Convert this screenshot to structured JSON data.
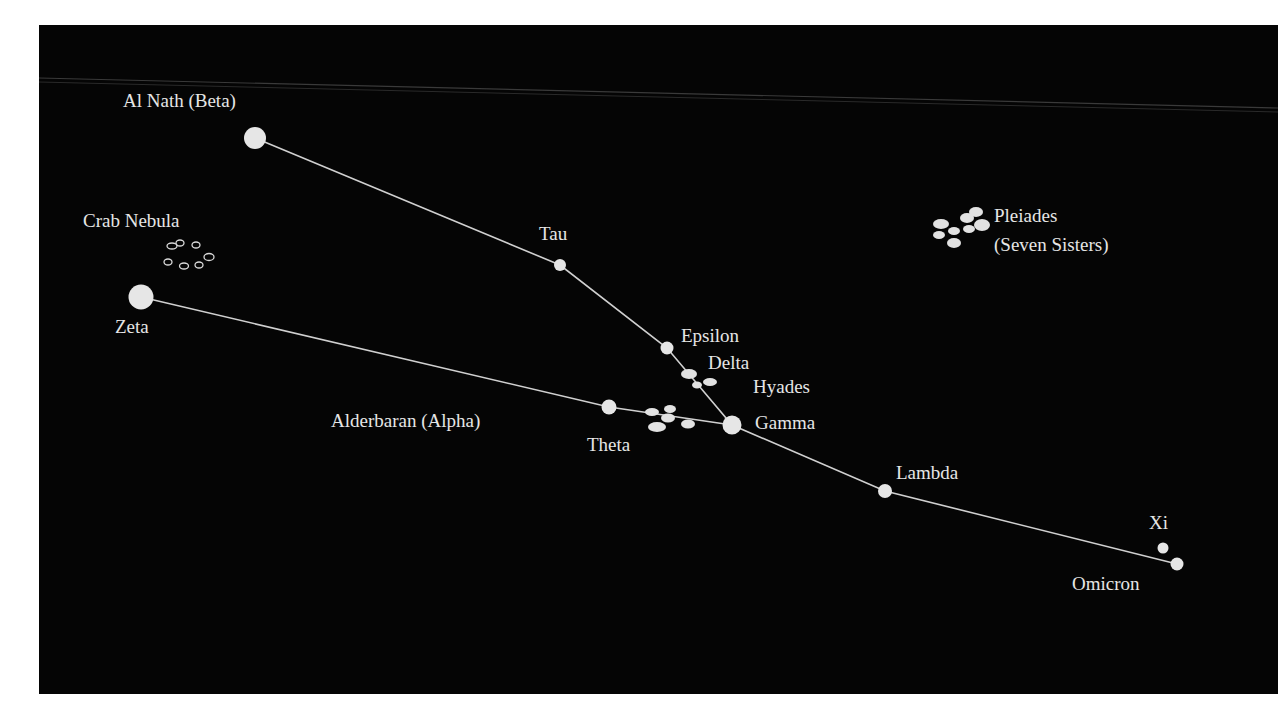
{
  "diagram": {
    "colors": {
      "background": "#050505",
      "star": "#e6e6e6",
      "line": "#d0d0d0",
      "text": "#e6e6e6"
    },
    "labels": {
      "al_nath": "Al Nath (Beta)",
      "crab_nebula": "Crab Nebula",
      "zeta": "Zeta",
      "tau": "Tau",
      "pleiades_line1": "Pleiades",
      "pleiades_line2": "(Seven Sisters)",
      "epsilon": "Epsilon",
      "delta": "Delta",
      "hyades": "Hyades",
      "alderbaran": "Alderbaran (Alpha)",
      "theta": "Theta",
      "gamma": "Gamma",
      "lambda": "Lambda",
      "xi": "Xi",
      "omicron": "Omicron"
    },
    "stars": [
      {
        "name": "Al Nath (Beta)",
        "x": 255,
        "y": 138,
        "r": 11
      },
      {
        "name": "Tau",
        "x": 560,
        "y": 265,
        "r": 6
      },
      {
        "name": "Epsilon",
        "x": 667,
        "y": 348,
        "r": 6
      },
      {
        "name": "Gamma",
        "x": 732,
        "y": 425,
        "r": 9
      },
      {
        "name": "Zeta",
        "x": 141,
        "y": 297,
        "r": 12
      },
      {
        "name": "Alderbaran (Alpha)",
        "x": 609,
        "y": 407,
        "r": 7
      },
      {
        "name": "Lambda",
        "x": 885,
        "y": 491,
        "r": 7
      },
      {
        "name": "Omicron",
        "x": 1177,
        "y": 564,
        "r": 6
      },
      {
        "name": "Xi",
        "x": 1163,
        "y": 548,
        "r": 5
      }
    ],
    "lines": [
      [
        "Al Nath (Beta)",
        "Tau",
        "Epsilon",
        "Gamma",
        "Lambda",
        "Omicron"
      ],
      [
        "Zeta",
        "Alderbaran (Alpha)",
        "Gamma"
      ]
    ]
  }
}
